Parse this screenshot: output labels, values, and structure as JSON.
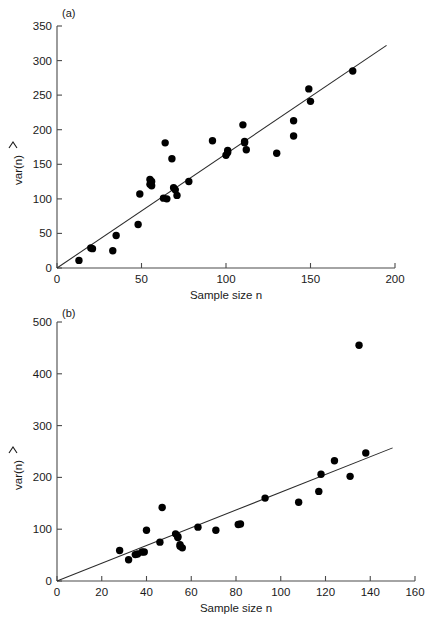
{
  "figure": {
    "background": "#ffffff",
    "point_color": "#000000",
    "axis_color": "#4a4a4a",
    "line_color": "#2b2b2b"
  },
  "panels": [
    {
      "id": "a",
      "label": "(a)",
      "xlabel": "Sample size n",
      "ylabel": "var(n)",
      "ylabel_accent": "hat",
      "xticks": [
        0,
        50,
        100,
        150,
        200
      ],
      "yticks": [
        0,
        50,
        100,
        150,
        200,
        250,
        300,
        350
      ]
    },
    {
      "id": "b",
      "label": "(b)",
      "xlabel": "Sample size n",
      "ylabel": "var(n)",
      "ylabel_accent": "hat",
      "xticks": [
        0,
        20,
        40,
        60,
        80,
        100,
        120,
        140,
        160
      ],
      "yticks": [
        0,
        100,
        200,
        300,
        400,
        500
      ]
    }
  ],
  "chart_data": [
    {
      "type": "scatter",
      "panel": "a",
      "title": "(a)",
      "xlabel": "Sample size n",
      "ylabel": "var(n)",
      "xlim": [
        0,
        200
      ],
      "ylim": [
        0,
        350
      ],
      "xticks": [
        0,
        50,
        100,
        150,
        200
      ],
      "yticks": [
        0,
        50,
        100,
        150,
        200,
        250,
        300,
        350
      ],
      "grid": false,
      "legend": "none",
      "points": [
        [
          13,
          11
        ],
        [
          20,
          29
        ],
        [
          21,
          28
        ],
        [
          33,
          25
        ],
        [
          35,
          47
        ],
        [
          48,
          63
        ],
        [
          49,
          107
        ],
        [
          55,
          121
        ],
        [
          55,
          128
        ],
        [
          56,
          125
        ],
        [
          56,
          119
        ],
        [
          63,
          101
        ],
        [
          64,
          181
        ],
        [
          65,
          100
        ],
        [
          68,
          158
        ],
        [
          69,
          116
        ],
        [
          70,
          113
        ],
        [
          71,
          105
        ],
        [
          78,
          125
        ],
        [
          92,
          184
        ],
        [
          100,
          163
        ],
        [
          101,
          170
        ],
        [
          101,
          167
        ],
        [
          110,
          207
        ],
        [
          111,
          183
        ],
        [
          111,
          181
        ],
        [
          112,
          171
        ],
        [
          130,
          166
        ],
        [
          140,
          213
        ],
        [
          140,
          191
        ],
        [
          149,
          259
        ],
        [
          150,
          241
        ],
        [
          175,
          285
        ]
      ],
      "fit_line": {
        "x": [
          0,
          195
        ],
        "y": [
          0,
          322
        ],
        "slope": 1.651,
        "intercept": 0
      }
    },
    {
      "type": "scatter",
      "panel": "b",
      "title": "(b)",
      "xlabel": "Sample size n",
      "ylabel": "var(n)",
      "xlim": [
        0,
        160
      ],
      "ylim": [
        0,
        500
      ],
      "xticks": [
        0,
        20,
        40,
        60,
        80,
        100,
        120,
        140,
        160
      ],
      "yticks": [
        0,
        100,
        200,
        300,
        400,
        500
      ],
      "grid": false,
      "legend": "none",
      "points": [
        [
          28,
          59
        ],
        [
          32,
          41
        ],
        [
          35,
          51
        ],
        [
          36,
          52
        ],
        [
          38,
          56
        ],
        [
          39,
          56
        ],
        [
          40,
          98
        ],
        [
          46,
          75
        ],
        [
          47,
          142
        ],
        [
          53,
          91
        ],
        [
          54,
          86
        ],
        [
          54,
          84
        ],
        [
          55,
          70
        ],
        [
          55,
          67
        ],
        [
          56,
          64
        ],
        [
          63,
          104
        ],
        [
          71,
          98
        ],
        [
          81,
          109
        ],
        [
          82,
          110
        ],
        [
          93,
          160
        ],
        [
          108,
          152
        ],
        [
          117,
          173
        ],
        [
          118,
          206
        ],
        [
          124,
          232
        ],
        [
          131,
          202
        ],
        [
          135,
          455
        ],
        [
          138,
          247
        ]
      ],
      "fit_line": {
        "x": [
          0,
          150
        ],
        "y": [
          0,
          257
        ],
        "slope": 1.713,
        "intercept": 0
      }
    }
  ]
}
